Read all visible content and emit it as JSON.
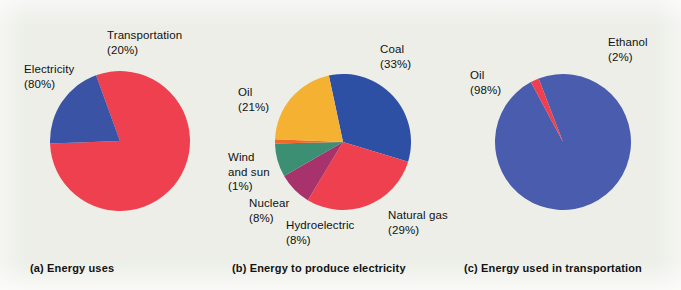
{
  "figure": {
    "background_color": "#eceee7",
    "width": 681,
    "height": 290
  },
  "chart_data": [
    {
      "type": "pie",
      "id": "energy-uses",
      "title": "(a) Energy uses",
      "caption": "(a) Energy uses",
      "categories": [
        "Electricity",
        "Transportation"
      ],
      "values": [
        80,
        20
      ],
      "value_labels": [
        "(80%)",
        "(20%)"
      ],
      "colors": [
        "#ef4050",
        "#3b53a4"
      ],
      "legend": "labels-outside",
      "start_angle_deg": -20,
      "center": [
        120,
        141
      ],
      "radius": 70,
      "labels": [
        {
          "name": "Electricity",
          "pct": "(80%)",
          "x": 24,
          "y": 62
        },
        {
          "name": "Transportation",
          "pct": "(20%)",
          "x": 107,
          "y": 28
        }
      ]
    },
    {
      "type": "pie",
      "id": "energy-to-produce-electricity",
      "title": "(b) Energy to produce electricity",
      "caption": "(b) Energy to produce electricity",
      "categories": [
        "Coal",
        "Natural gas",
        "Hydroelectric",
        "Nuclear",
        "Wind and sun",
        "Oil"
      ],
      "values": [
        33,
        29,
        8,
        8,
        1,
        21
      ],
      "value_labels": [
        "(33%)",
        "(29%)",
        "(8%)",
        "(8%)",
        "(1%)",
        "(21%)"
      ],
      "colors": [
        "#2e50a4",
        "#ef4050",
        "#a8326b",
        "#3d8f73",
        "#ef6a2a",
        "#f5b232"
      ],
      "legend": "labels-outside",
      "start_angle_deg": -12,
      "center": [
        343,
        142
      ],
      "radius": 68,
      "labels": [
        {
          "name": "Coal",
          "pct": "(33%)",
          "x": 380,
          "y": 42
        },
        {
          "name": "Oil",
          "pct": "(21%)",
          "x": 238,
          "y": 85
        },
        {
          "name": "Wind and sun",
          "pct": "(1%)",
          "x": 228,
          "y": 150
        },
        {
          "name": "Nuclear",
          "pct": "(8%)",
          "x": 249,
          "y": 196
        },
        {
          "name": "Hydroelectric",
          "pct": "(8%)",
          "x": 286,
          "y": 218
        },
        {
          "name": "Natural gas",
          "pct": "(29%)",
          "x": 388,
          "y": 208
        }
      ]
    },
    {
      "type": "pie",
      "id": "energy-used-in-transportation",
      "title": "(c) Energy used in transportation",
      "caption": "(c) Energy used in transportation",
      "categories": [
        "Oil",
        "Ethanol"
      ],
      "values": [
        98,
        2
      ],
      "value_labels": [
        "(98%)",
        "(2%)"
      ],
      "colors": [
        "#4a5cad",
        "#ef4050"
      ],
      "legend": "labels-outside",
      "start_angle_deg": -21,
      "center": [
        563,
        142
      ],
      "radius": 68,
      "labels": [
        {
          "name": "Oil",
          "pct": "(98%)",
          "x": 470,
          "y": 68
        },
        {
          "name": "Ethanol",
          "pct": "(2%)",
          "x": 608,
          "y": 35
        }
      ]
    }
  ],
  "panels": [
    {
      "caption": "(a) Energy uses",
      "caption_x": 30,
      "caption_y": 262
    },
    {
      "caption": "(b) Energy to produce electricity",
      "caption_x": 232,
      "caption_y": 262
    },
    {
      "caption": "(c) Energy used in transportation",
      "caption_x": 464,
      "caption_y": 262
    }
  ]
}
